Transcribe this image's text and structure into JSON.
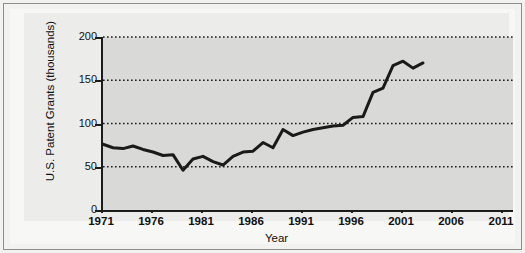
{
  "figure": {
    "background_color": "#f2f2f0",
    "panel_color": "#ececeb",
    "plot_background_color": "#d9d9d7",
    "line_color": "#1a1a1a",
    "axis_color": "#1c1c1c",
    "gridline_color": "#1c1c1c"
  },
  "chart_data": {
    "type": "line",
    "title": "",
    "subtitle": "",
    "xlabel": "Year",
    "ylabel": "U.S. Patent Grants (thousands)",
    "xlim": [
      1971,
      2012
    ],
    "ylim": [
      0,
      200
    ],
    "xticks": [
      1971,
      1976,
      1981,
      1986,
      1991,
      1996,
      2001,
      2006,
      2011
    ],
    "xticklabels": [
      "1971",
      "1976",
      "1981",
      "1986",
      "1991",
      "1996",
      "2001",
      "2006",
      "2011"
    ],
    "yticks": [
      0,
      50,
      100,
      150,
      200
    ],
    "yticklabels": [
      "0",
      "50",
      "100",
      "150",
      "200"
    ],
    "grid": true,
    "grid_axis": "y",
    "grid_style": "dotted",
    "legend": false,
    "legend_position": "none",
    "series": [
      {
        "name": "U.S. Patent Grants",
        "units": "thousands",
        "x": [
          1971,
          1972,
          1973,
          1974,
          1975,
          1976,
          1977,
          1978,
          1979,
          1980,
          1981,
          1982,
          1983,
          1984,
          1985,
          1986,
          1987,
          1988,
          1989,
          1990,
          1991,
          1992,
          1993,
          1994,
          1995,
          1996,
          1997,
          1998,
          1999,
          2000,
          2001,
          2002,
          2003
        ],
        "values": [
          76,
          72,
          71,
          74,
          70,
          67,
          63,
          64,
          46,
          59,
          62,
          56,
          52,
          62,
          67,
          68,
          78,
          72,
          93,
          86,
          90,
          93,
          95,
          97,
          98,
          107,
          108,
          136,
          141,
          167,
          172,
          164,
          170
        ]
      }
    ]
  }
}
